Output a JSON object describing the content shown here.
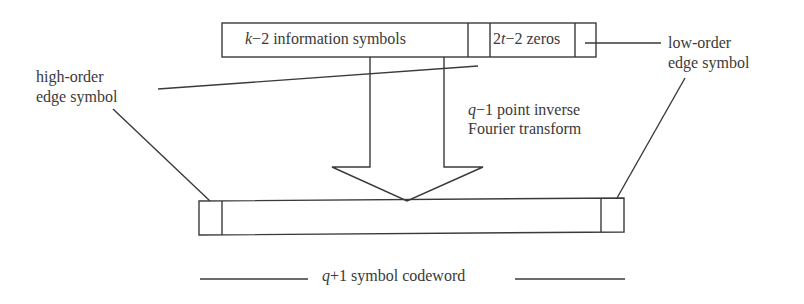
{
  "diagram": {
    "top_frame": {
      "info_label_var": "k",
      "info_label_rest": "−2 information symbols",
      "zeros_label_num": "2",
      "zeros_label_var": "t",
      "zeros_label_rest": "−2 zeros"
    },
    "labels": {
      "high_order_line1": "high-order",
      "high_order_line2": "edge symbol",
      "low_order_line1": "low-order",
      "low_order_line2": "edge symbol",
      "transform_var": "q",
      "transform_line1_rest": "−1 point inverse",
      "transform_line2": "Fourier transform",
      "codeword_var": "q",
      "codeword_rest": "+1 symbol codeword"
    },
    "colors": {
      "stroke": "#3a3a3a",
      "background": "#ffffff"
    }
  }
}
